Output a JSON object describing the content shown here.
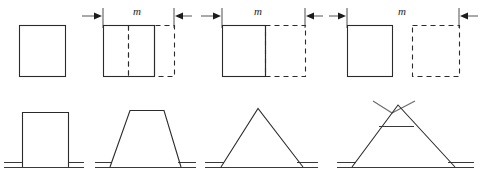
{
  "figure": {
    "background_color": "#ffffff",
    "stroke_color": "#2b2b2b",
    "dim_color": "#555555",
    "labels": {
      "m_1": "m",
      "m_2": "m",
      "m_3": "m"
    },
    "top_row": {
      "panels": [
        {
          "id": "panel-1",
          "name": "initial-block",
          "solid_rect": {
            "x": 19,
            "y": 25,
            "w": 46,
            "h": 51
          },
          "dashed_rect": null,
          "inner_dashed_line_x": null,
          "inner_solid_line_x": null,
          "label": null
        },
        {
          "id": "panel-2",
          "name": "block-overlap-large",
          "solid_rect": {
            "x": 103,
            "y": 25,
            "w": 51,
            "h": 51
          },
          "dashed_rect": {
            "x": 128,
            "y": 25,
            "w": 46,
            "h": 51
          },
          "inner_dashed_line_x": 128,
          "inner_solid_line_x": 154,
          "label": "m"
        },
        {
          "id": "panel-3",
          "name": "block-overlap-edge",
          "solid_rect": {
            "x": 222,
            "y": 25,
            "w": 43,
            "h": 51
          },
          "dashed_rect": {
            "x": 265,
            "y": 25,
            "w": 40,
            "h": 51
          },
          "inner_dashed_line_x": null,
          "inner_solid_line_x": 265,
          "label": "m"
        },
        {
          "id": "panel-4",
          "name": "block-separated",
          "solid_rect": {
            "x": 347,
            "y": 25,
            "w": 45,
            "h": 51
          },
          "dashed_rect": {
            "x": 412,
            "y": 25,
            "w": 47,
            "h": 51
          },
          "inner_dashed_line_x": null,
          "inner_solid_line_x": null,
          "label": "m"
        }
      ],
      "dimension_arrows": [
        {
          "id": "arrow-in-left-1",
          "direction": "right",
          "x_from": 82,
          "x_to": 102,
          "y": 16,
          "tick_x": 103
        },
        {
          "id": "arrow-out-left-1",
          "direction": "left",
          "x_from": 192,
          "x_to": 175,
          "y": 16,
          "tick_x": 174
        },
        {
          "id": "arrow-out-right-1",
          "direction": "right",
          "x_from": 200,
          "x_to": 220,
          "y": 16,
          "tick_x": 222
        },
        {
          "id": "arrow-out-left-2",
          "direction": "left",
          "x_from": 323,
          "x_to": 307,
          "y": 16,
          "tick_x": 305
        },
        {
          "id": "arrow-out-right-2",
          "direction": "right",
          "x_from": 328,
          "x_to": 345,
          "y": 16,
          "tick_x": 347
        },
        {
          "id": "arrow-in-right-2",
          "direction": "left",
          "x_from": 478,
          "x_to": 461,
          "y": 16,
          "tick_x": 459
        }
      ]
    },
    "bottom_row": {
      "profiles": [
        {
          "id": "profile-1",
          "name": "rectangular-profile",
          "type": "rectangle",
          "ground_y": 166,
          "ground_x_from": 4,
          "ground_x_to": 82,
          "shape_points": "22,162 22,112 68,112 68,162"
        },
        {
          "id": "profile-2",
          "name": "trapezoidal-profile",
          "type": "trapezoid",
          "ground_y": 166,
          "ground_x_from": 95,
          "ground_x_to": 185,
          "shape_points": "108,162 128,110 165,110 180,162"
        },
        {
          "id": "profile-3",
          "name": "triangular-profile",
          "type": "triangle",
          "ground_y": 166,
          "ground_x_from": 205,
          "ground_x_to": 315,
          "shape_points": "219,162 258,108 303,162"
        },
        {
          "id": "profile-4",
          "name": "crossed-triangular-profile",
          "type": "crossed-triangle",
          "ground_y": 166,
          "ground_x_from": 337,
          "ground_x_to": 472,
          "shape_points": "350,162 392,110 455,162",
          "cross_extension": true,
          "chord_y": 126,
          "chord_x_from": 380,
          "chord_x_to": 412
        }
      ]
    }
  }
}
